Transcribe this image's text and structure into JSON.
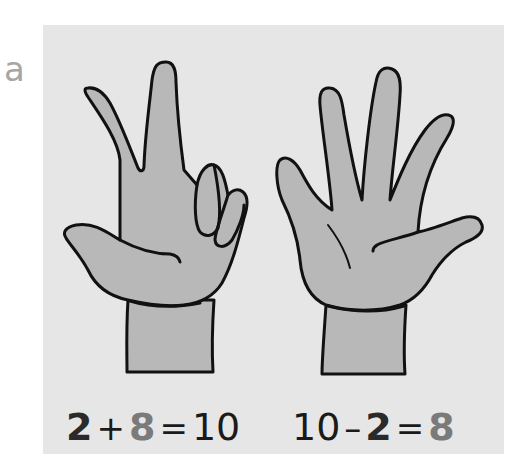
{
  "label": "a",
  "colors": {
    "panel": "#e6e6e6",
    "hand_fill": "#b8b8b8",
    "outline": "#111111",
    "label": "#a6a6a6",
    "highlight_number": "#7a7a7a",
    "primary_number": "#2a2a2a"
  },
  "hands": [
    {
      "id": "left",
      "description": "hand showing 2 fingers up, 3 fingers folded",
      "fingers_up": 2
    },
    {
      "id": "right",
      "description": "open hand showing 5 fingers",
      "fingers_up": 5
    }
  ],
  "equations": [
    {
      "a": "2",
      "op1": "+",
      "b": "8",
      "op2": "=",
      "c": "10"
    },
    {
      "a": "10",
      "op1": "–",
      "b": "2",
      "op2": "=",
      "c": "8"
    }
  ]
}
